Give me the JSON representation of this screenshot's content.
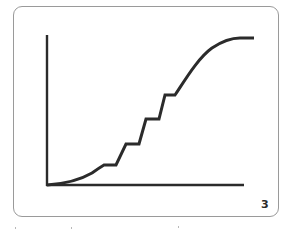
{
  "figure": {
    "panel_number": "3",
    "type": "stepped sigmoid curve on unlabeled axes",
    "axes": {
      "x_label": "",
      "y_label": "",
      "ticks": "none"
    },
    "curve": {
      "description": "S-shaped growth curve with four horizontal plateaus (steps) along its rising middle section, leveling off at the top right",
      "stroke_color": "#2b2b2b",
      "step_count": 4
    },
    "colors": {
      "line": "#2b2b2b",
      "frame_border": "#9a9a9a",
      "background": "#ffffff"
    }
  }
}
